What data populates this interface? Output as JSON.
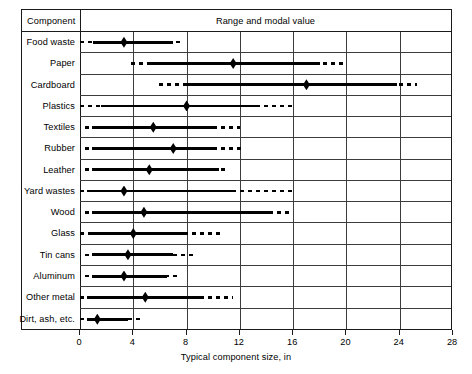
{
  "table": {
    "component_header": "Component",
    "range_header": "Range and modal value"
  },
  "axis": {
    "title": "Typical component size, in",
    "ticks": [
      {
        "value": 0,
        "label": "0"
      },
      {
        "value": 4,
        "label": "4"
      },
      {
        "value": 8,
        "label": "8"
      },
      {
        "value": 12,
        "label": "12"
      },
      {
        "value": 16,
        "label": "16"
      },
      {
        "value": 20,
        "label": "20"
      },
      {
        "value": 24,
        "label": "24"
      },
      {
        "value": 28,
        "label": "28"
      }
    ],
    "gridlines": [
      4,
      8,
      12,
      16,
      20,
      24
    ]
  },
  "chart_data": {
    "type": "bar",
    "title": "Range and modal value",
    "xlabel": "Typical component size, in",
    "ylabel": "Component",
    "xlim": [
      0,
      28
    ],
    "grid": true,
    "legend": "none",
    "orientation": "horizontal",
    "categories": [
      "Food waste",
      "Paper",
      "Cardboard",
      "Plastics",
      "Textiles",
      "Rubber",
      "Leather",
      "Yard wastes",
      "Wood",
      "Glass",
      "Tin cans",
      "Aluminum",
      "Other metal",
      "Dirt, ash, etc."
    ],
    "rows": [
      {
        "category": "Food waste",
        "dash_start": 0.0,
        "solid_start": 1.0,
        "modal": 3.3,
        "solid_end": 7.0,
        "dash_end": 7.6
      },
      {
        "category": "Paper",
        "dash_start": 3.8,
        "solid_start": 5.2,
        "modal": 11.5,
        "solid_end": 18.0,
        "dash_end": 20.0
      },
      {
        "category": "Cardboard",
        "dash_start": 5.9,
        "solid_start": 8.0,
        "modal": 17.0,
        "solid_end": 23.8,
        "dash_end": 25.3
      },
      {
        "category": "Plastics",
        "dash_start": 0.0,
        "solid_start": 1.6,
        "modal": 8.0,
        "solid_end": 13.5,
        "dash_end": 16.0
      },
      {
        "category": "Textiles",
        "dash_start": 0.4,
        "solid_start": 0.9,
        "modal": 5.5,
        "solid_end": 10.0,
        "dash_end": 12.0
      },
      {
        "category": "Rubber",
        "dash_start": 0.4,
        "solid_start": 0.9,
        "modal": 7.0,
        "solid_end": 10.2,
        "dash_end": 12.1
      },
      {
        "category": "Leather",
        "dash_start": 0.4,
        "solid_start": 0.9,
        "modal": 5.2,
        "solid_end": 10.4,
        "dash_end": 11.0
      },
      {
        "category": "Yard wastes",
        "dash_start": 0.0,
        "solid_start": 0.5,
        "modal": 3.3,
        "solid_end": 11.5,
        "dash_end": 16.0
      },
      {
        "category": "Wood",
        "dash_start": 0.4,
        "solid_start": 0.9,
        "modal": 4.8,
        "solid_end": 14.2,
        "dash_end": 15.8
      },
      {
        "category": "Glass",
        "dash_start": 0.0,
        "solid_start": 0.9,
        "modal": 4.0,
        "solid_end": 8.0,
        "dash_end": 10.5
      },
      {
        "category": "Tin cans",
        "dash_start": 0.4,
        "solid_start": 0.9,
        "modal": 3.6,
        "solid_end": 7.0,
        "dash_end": 8.5
      },
      {
        "category": "Aluminum",
        "dash_start": 0.4,
        "solid_start": 0.9,
        "modal": 3.3,
        "solid_end": 6.5,
        "dash_end": 7.5
      },
      {
        "category": "Other metal",
        "dash_start": 0.0,
        "solid_start": 0.5,
        "modal": 4.9,
        "solid_end": 9.0,
        "dash_end": 11.5
      },
      {
        "category": "Dirt, ash, etc.",
        "dash_start": 0.0,
        "solid_start": 0.5,
        "modal": 1.3,
        "solid_end": 3.6,
        "dash_end": 4.6
      }
    ]
  }
}
